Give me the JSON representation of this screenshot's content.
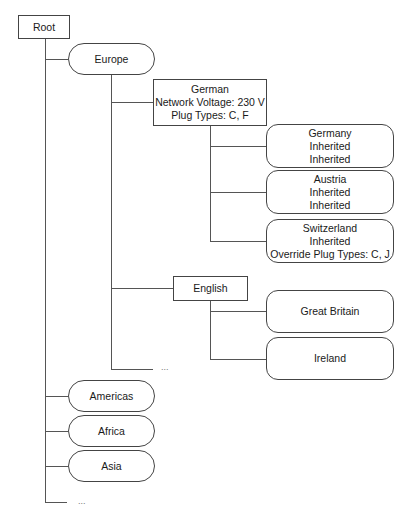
{
  "diagram": {
    "type": "tree",
    "root": {
      "label": "Root"
    },
    "regions": [
      {
        "label": "Europe",
        "groups": [
          {
            "label": "German",
            "lines": [
              "German",
              "Network Voltage: 230 V",
              "Plug Types: C, F"
            ],
            "countries": [
              {
                "lines": [
                  "Germany",
                  "Inherited",
                  "Inherited"
                ]
              },
              {
                "lines": [
                  "Austria",
                  "Inherited",
                  "Inherited"
                ]
              },
              {
                "lines": [
                  "Switzerland",
                  "Inherited",
                  "Override Plug Types: C, J"
                ]
              }
            ]
          },
          {
            "label": "English",
            "countries": [
              {
                "lines": [
                  "Great Britain"
                ]
              },
              {
                "lines": [
                  "Ireland"
                ]
              }
            ]
          }
        ],
        "more": "..."
      },
      {
        "label": "Americas"
      },
      {
        "label": "Africa"
      },
      {
        "label": "Asia"
      }
    ],
    "more": "..."
  }
}
